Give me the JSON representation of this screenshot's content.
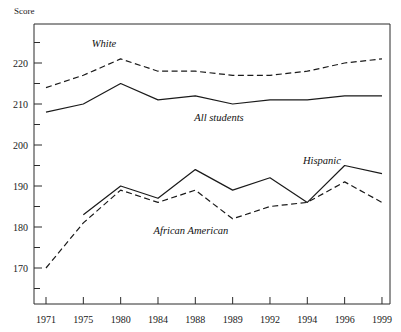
{
  "chart_data": {
    "type": "line",
    "title": "",
    "subtitle": "",
    "ylabel": "Score",
    "xlabel": "",
    "categories": [
      "1971",
      "1975",
      "1980",
      "1984",
      "1988",
      "1989",
      "1992",
      "1994",
      "1996",
      "1999"
    ],
    "ylim": [
      163,
      228
    ],
    "y_major_ticks": [
      170,
      180,
      190,
      200,
      210,
      220
    ],
    "y_minor_ticks": [
      165,
      175,
      185,
      195,
      205,
      215,
      225
    ],
    "y_tick_labels": [
      "170",
      "180",
      "190",
      "200",
      "210",
      "220"
    ],
    "grid": false,
    "legend_position": "inline-annotations",
    "series": [
      {
        "name": "White",
        "style": "dashed",
        "label_text": "White",
        "values": [
          214,
          217,
          221,
          218,
          218,
          217,
          217,
          218,
          220,
          221
        ]
      },
      {
        "name": "All students",
        "style": "solid",
        "label_text": "All students",
        "values": [
          208,
          210,
          215,
          211,
          212,
          210,
          211,
          211,
          212,
          212
        ]
      },
      {
        "name": "Hispanic",
        "style": "solid",
        "label_text": "Hispanic",
        "values": [
          null,
          183,
          190,
          187,
          194,
          189,
          192,
          186,
          195,
          193
        ]
      },
      {
        "name": "African American",
        "style": "dashed",
        "label_text": "African American",
        "values": [
          170,
          181,
          189,
          186,
          189,
          182,
          185,
          186,
          191,
          186
        ]
      }
    ],
    "annotations": [
      {
        "text": "White",
        "x_px": 104,
        "y_px": 47
      },
      {
        "text": "All students",
        "x_px": 219,
        "y_px": 121
      },
      {
        "text": "Hispanic",
        "x_px": 322,
        "y_px": 164
      },
      {
        "text": "African American",
        "x_px": 191,
        "y_px": 234
      }
    ],
    "colors": {
      "line": "#1a1a1a",
      "axis": "#2b2b2b",
      "background": "#ffffff",
      "text": "#1a1a1a"
    }
  }
}
